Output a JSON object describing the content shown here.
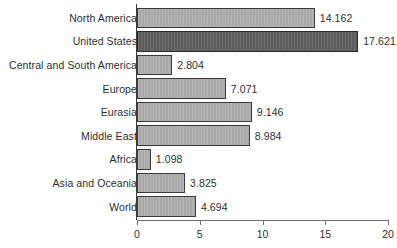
{
  "chart_data": {
    "type": "bar",
    "orientation": "horizontal",
    "title": "",
    "subtitle": "",
    "xlabel": "",
    "ylabel": "",
    "xlim": [
      0,
      20
    ],
    "ticks": [
      "0",
      "5",
      "10",
      "15",
      "20"
    ],
    "tick_values": [
      0,
      5,
      10,
      15,
      20
    ],
    "grid": false,
    "legend": null,
    "categories": [
      "North America",
      "United States",
      "Central and South America",
      "Europe",
      "Eurasia",
      "Middle East",
      "Africa",
      "Asia and Oceania",
      "World"
    ],
    "values": [
      14.162,
      17.621,
      2.804,
      7.071,
      9.146,
      8.984,
      1.098,
      3.825,
      4.694
    ],
    "value_labels": [
      "14.162",
      "17.621",
      "2.804",
      "7.071",
      "9.146",
      "8.984",
      "1.098",
      "3.825",
      "4.694"
    ],
    "highlight_index": 1,
    "colors": {
      "bar_fill": "#a9a9a9",
      "bar_border": "#3a3a3a",
      "highlight_fill": "#5c5c5c",
      "highlight_border": "#2b2b2b",
      "axis": "#6f6f6f",
      "text": "#2e2e2e",
      "background": "#ffffff"
    }
  }
}
